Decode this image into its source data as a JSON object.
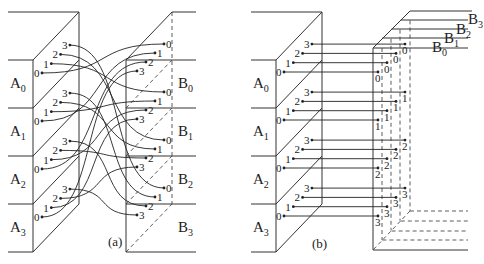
{
  "panels": [
    {
      "id": "a",
      "caption": "(a)",
      "source_groups": [
        "A0",
        "A1",
        "A2",
        "A3"
      ],
      "target_groups": [
        "B0",
        "B1",
        "B2",
        "B3"
      ],
      "ports": [
        "0",
        "1",
        "2",
        "3"
      ],
      "mapping": "A_i port j -> B_j port i (curved wires)"
    },
    {
      "id": "b",
      "caption": "(b)",
      "source_groups": [
        "A0",
        "A1",
        "A2",
        "A3"
      ],
      "target_groups": [
        "B0",
        "B1",
        "B2",
        "B3"
      ],
      "ports": [
        "0",
        "1",
        "2",
        "3"
      ],
      "mapping": "A_i port j -> B_j port i (straight wires, 3D stacked planes)"
    }
  ],
  "labels": {
    "a_caption": "(a)",
    "b_caption": "(b)",
    "A": "A",
    "B": "B"
  }
}
